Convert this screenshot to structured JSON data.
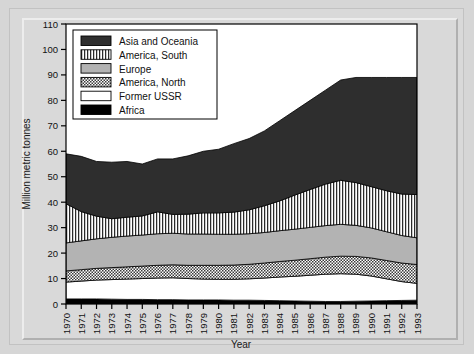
{
  "chart_data": {
    "type": "area",
    "stacked": true,
    "title": "",
    "xlabel": "Year",
    "ylabel": "Million metric tonnes",
    "ylim": [
      0,
      110
    ],
    "ytick_step": 10,
    "yticks": [
      0,
      10,
      20,
      30,
      40,
      50,
      60,
      70,
      80,
      90,
      100,
      110
    ],
    "grid": false,
    "legend_position": "top-left-inside",
    "categories": [
      1970,
      1971,
      1972,
      1973,
      1974,
      1975,
      1976,
      1977,
      1978,
      1979,
      1980,
      1981,
      1982,
      1983,
      1984,
      1985,
      1986,
      1987,
      1988,
      1989,
      1990,
      1991,
      1992,
      1993
    ],
    "xtick_labels": [
      "1970",
      "1971",
      "1972",
      "1973",
      "1974",
      "1975",
      "1976",
      "1977",
      "1978",
      "1979",
      "1980",
      "1981",
      "1982",
      "1983",
      "1984",
      "1985",
      "1986",
      "1987",
      "1988",
      "1989",
      "1990",
      "1991",
      "1992",
      "1993"
    ],
    "stack_order_bottom_to_top": [
      "Africa",
      "Former USSR",
      "America, North",
      "Europe",
      "America, South",
      "Asia and Oceania"
    ],
    "series": [
      {
        "name": "Africa",
        "fill": "#000000",
        "pattern": "solid-black",
        "values": [
          2.0,
          2.0,
          2.0,
          1.9,
          1.8,
          1.8,
          1.7,
          1.7,
          1.6,
          1.6,
          1.6,
          1.5,
          1.5,
          1.4,
          1.3,
          1.2,
          1.1,
          1.0,
          1.0,
          1.1,
          1.2,
          1.3,
          1.4,
          1.5
        ]
      },
      {
        "name": "Former USSR",
        "fill": "#ffffff",
        "pattern": "solid-white",
        "values": [
          6.6,
          7.0,
          7.4,
          7.7,
          8.0,
          8.2,
          8.5,
          8.6,
          8.4,
          8.2,
          8.1,
          8.2,
          8.4,
          8.8,
          9.3,
          9.7,
          10.2,
          10.7,
          10.9,
          10.6,
          9.8,
          8.6,
          7.4,
          6.6
        ]
      },
      {
        "name": "America, North",
        "fill": "#c9c9c9",
        "pattern": "checker",
        "values": [
          4.4,
          4.5,
          4.6,
          4.7,
          4.8,
          4.9,
          5.0,
          5.1,
          5.2,
          5.4,
          5.5,
          5.6,
          5.7,
          5.9,
          6.1,
          6.3,
          6.5,
          6.7,
          6.9,
          7.0,
          7.1,
          7.2,
          7.3,
          7.4
        ]
      },
      {
        "name": "Europe",
        "fill": "#b3b3b3",
        "pattern": "solid-gray",
        "values": [
          11.0,
          11.3,
          11.6,
          11.9,
          12.1,
          12.2,
          12.4,
          12.4,
          12.3,
          12.3,
          12.2,
          12.1,
          12.0,
          12.0,
          12.1,
          12.2,
          12.3,
          12.4,
          12.5,
          12.2,
          11.8,
          11.3,
          10.8,
          10.5
        ]
      },
      {
        "name": "America, South",
        "fill": "#e8e8e8",
        "pattern": "vertical-stripes",
        "values": [
          15.4,
          11.5,
          8.9,
          7.3,
          7.4,
          7.5,
          8.6,
          7.4,
          7.8,
          8.3,
          8.4,
          8.7,
          9.4,
          10.5,
          11.7,
          13.4,
          14.9,
          16.3,
          17.3,
          16.8,
          16.2,
          16.1,
          16.3,
          17.0
        ]
      },
      {
        "name": "Asia and Oceania",
        "fill": "#2e2e2e",
        "pattern": "solid-darkgray",
        "values": [
          19.6,
          21.7,
          21.5,
          22.2,
          21.9,
          20.4,
          20.8,
          21.8,
          22.9,
          24.2,
          25.0,
          26.9,
          28.0,
          29.4,
          31.5,
          33.2,
          35.0,
          36.9,
          39.4,
          41.3,
          42.9,
          44.5,
          45.8,
          46.0
        ]
      }
    ],
    "totals": [
      59.0,
      58.0,
      56.0,
      55.7,
      56.0,
      55.0,
      57.0,
      57.0,
      56.2,
      58.0,
      58.8,
      61.0,
      63.0,
      66.0,
      69.0,
      73.0,
      76.0,
      80.0,
      84.0,
      83.0,
      81.0,
      80.0,
      80.0,
      82.0
    ]
  },
  "legend": {
    "entries": [
      {
        "label": "Asia and Oceania",
        "swatch": "solid-darkgray"
      },
      {
        "label": "America, South",
        "swatch": "vertical-stripes"
      },
      {
        "label": "Europe",
        "swatch": "solid-gray"
      },
      {
        "label": "America, North",
        "swatch": "checker"
      },
      {
        "label": "Former USSR",
        "swatch": "solid-white"
      },
      {
        "label": "Africa",
        "swatch": "solid-black"
      }
    ]
  },
  "axes": {
    "y_title": "Million metric tonnes",
    "x_title": "Year"
  }
}
